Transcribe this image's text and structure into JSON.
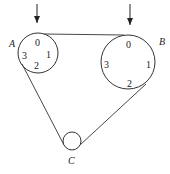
{
  "diagram": {
    "type": "pulley-belt-system",
    "pulleys": [
      {
        "id": "A",
        "label": "A",
        "cx": 38,
        "cy": 53,
        "r": 20,
        "marks": [
          "0",
          "1",
          "2",
          "3"
        ]
      },
      {
        "id": "B",
        "label": "B",
        "cx": 128,
        "cy": 62,
        "r": 27,
        "marks": [
          "0",
          "1",
          "2",
          "3"
        ]
      },
      {
        "id": "C",
        "label": "C",
        "cx": 72,
        "cy": 141,
        "r": 9,
        "marks": []
      }
    ],
    "arrows": [
      {
        "target": "A",
        "x": 37,
        "y1": 4,
        "y2": 30
      },
      {
        "target": "B",
        "x": 130,
        "y1": 4,
        "y2": 32
      }
    ],
    "labels": {
      "A": "A",
      "B": "B",
      "C": "C",
      "A_marks": {
        "top": "0",
        "right": "1",
        "bottom": "2",
        "left": "3"
      },
      "B_marks": {
        "top": "0",
        "right": "1",
        "bottom": "2",
        "left": "3"
      }
    }
  }
}
